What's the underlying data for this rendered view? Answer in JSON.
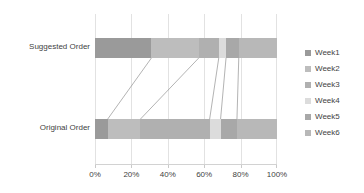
{
  "chart_data": {
    "type": "bar",
    "subtype": "stacked-horizontal-100-percent",
    "title": "",
    "xlabel": "",
    "ylabel": "",
    "xlim": [
      0,
      100
    ],
    "xticks": [
      "0%",
      "20%",
      "40%",
      "60%",
      "80%",
      "100%"
    ],
    "xtick_values": [
      0,
      20,
      40,
      60,
      80,
      100
    ],
    "grid": true,
    "legend_position": "right",
    "categories": [
      "Suggested Order",
      "Original Order"
    ],
    "series": [
      {
        "name": "Week1",
        "color": "#9a9a9a",
        "values": [
          31,
          7
        ]
      },
      {
        "name": "Week2",
        "color": "#bdbdbd",
        "values": [
          26,
          18
        ]
      },
      {
        "name": "Week3",
        "color": "#b0b0b0",
        "values": [
          11,
          38
        ]
      },
      {
        "name": "Week4",
        "color": "#dcdcdc",
        "values": [
          4,
          6
        ]
      },
      {
        "name": "Week5",
        "color": "#a8a8a8",
        "values": [
          7,
          9
        ]
      },
      {
        "name": "Week6",
        "color": "#b8b8b8",
        "values": [
          21,
          22
        ]
      }
    ],
    "connectors": [
      {
        "top_pct": 31,
        "bottom_pct": 7
      },
      {
        "top_pct": 57,
        "bottom_pct": 25
      },
      {
        "top_pct": 68,
        "bottom_pct": 63
      },
      {
        "top_pct": 72,
        "bottom_pct": 69
      },
      {
        "top_pct": 79,
        "bottom_pct": 78
      }
    ],
    "connector_color": "#808080"
  },
  "axis": {
    "tick_0": "0%",
    "tick_1": "20%",
    "tick_2": "40%",
    "tick_3": "60%",
    "tick_4": "80%",
    "tick_5": "100%"
  },
  "categories": {
    "suggested": "Suggested Order",
    "original": "Original Order"
  },
  "legend": {
    "items": [
      {
        "label": "Week1"
      },
      {
        "label": "Week2"
      },
      {
        "label": "Week3"
      },
      {
        "label": "Week4"
      },
      {
        "label": "Week5"
      },
      {
        "label": "Week6"
      }
    ]
  }
}
